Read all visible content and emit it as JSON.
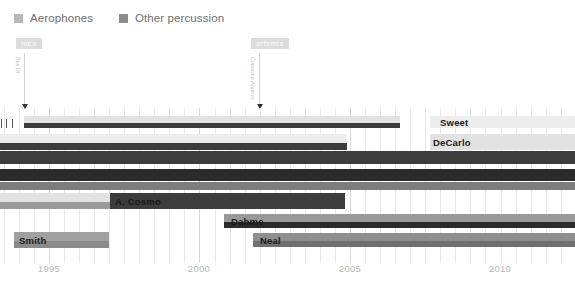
{
  "legend": {
    "items": [
      {
        "label": "Aerophones",
        "color": "#b7b7b7"
      },
      {
        "label": "Other percussion",
        "color": "#8c8c8c"
      }
    ]
  },
  "events": [
    {
      "name": "mco",
      "pill_label": "mco",
      "vertical_label": "Bks Dr",
      "x": 24
    },
    {
      "name": "artemis",
      "pill_label": "artemis",
      "vertical_label": "Coporate Amercy",
      "x": 259
    }
  ],
  "axis": {
    "ticks": [
      {
        "label": "1995",
        "x": 49
      },
      {
        "label": "2000",
        "x": 199
      },
      {
        "label": "2005",
        "x": 350
      },
      {
        "label": "2010",
        "x": 500
      }
    ],
    "minor_step_px": 30.1,
    "x_min_year": 1993.4,
    "x_max_year": 2012.3
  },
  "colors": {
    "light": "#e2e2e2",
    "lightest": "#ededed",
    "mid": "#9a9a9a",
    "dark": "#3c3c3c",
    "darkest": "#2b2b2b",
    "grid": "#e9e9e9",
    "grid_major": "#d8d8d8",
    "axis_text": "#b9b9b9",
    "legend_text": "#6e6e6e",
    "event_pill_bg": "#dcdcdc",
    "event_pill_text": "#f4f4f4"
  },
  "chart_data": {
    "type": "bar",
    "title": "",
    "xlabel": "",
    "ylabel": "",
    "orientation": "horizontal-timeline",
    "grid": true,
    "legend_position": "top-left",
    "xlim": [
      1993.4,
      2012.3
    ],
    "categories": [
      "Sweet",
      "DeCarlo",
      "row-3",
      "row-4",
      "row-5",
      "A. Cosmo",
      "Dahme",
      "Neal",
      "Smith"
    ],
    "rows": [
      {
        "name": "sweet-row",
        "label": "Sweet",
        "label_x": 437,
        "y": 116,
        "height": 12,
        "segments": [
          {
            "x": 24,
            "width": 376,
            "color": "#e2e2e2",
            "band": "top",
            "series": "Aerophones"
          },
          {
            "x": 24,
            "width": 376,
            "color": "#3c3c3c",
            "band": "bottom",
            "series": "Other percussion"
          },
          {
            "x": 430,
            "width": 145,
            "color": "#ededed",
            "band": "full",
            "series": "Aerophones"
          }
        ]
      },
      {
        "name": "decarlo-row",
        "label": "DeCarlo",
        "label_x": 430,
        "y": 134,
        "height": 16,
        "segments": [
          {
            "x": 0,
            "width": 347,
            "color": "#ededed",
            "band": "top",
            "series": "Aerophones"
          },
          {
            "x": 0,
            "width": 347,
            "color": "#3c3c3c",
            "band": "bottom",
            "series": "Other percussion"
          },
          {
            "x": 430,
            "width": 145,
            "color": "#e2e2e2",
            "band": "full",
            "series": "Aerophones"
          }
        ]
      },
      {
        "name": "row-3",
        "label": "",
        "y": 151,
        "height": 13,
        "segments": [
          {
            "x": 0,
            "width": 575,
            "color": "#3c3c3c",
            "band": "full",
            "series": "Other percussion"
          }
        ]
      },
      {
        "name": "row-4",
        "label": "",
        "y": 169,
        "height": 12,
        "segments": [
          {
            "x": 0,
            "width": 575,
            "color": "#2b2b2b",
            "band": "full",
            "series": "Other percussion"
          }
        ]
      },
      {
        "name": "row-5",
        "label": "",
        "y": 182,
        "height": 8,
        "segments": [
          {
            "x": 0,
            "width": 575,
            "color": "#7d7d7d",
            "band": "full",
            "series": "Other percussion"
          }
        ]
      },
      {
        "name": "acosmo-row",
        "label": "A. Cosmo",
        "label_x": 112,
        "y": 193,
        "height": 16,
        "segments": [
          {
            "x": 0,
            "width": 110,
            "color": "#e2e2e2",
            "band": "top",
            "series": "Aerophones"
          },
          {
            "x": 0,
            "width": 110,
            "color": "#9a9a9a",
            "band": "bottom",
            "series": "Other percussion"
          },
          {
            "x": 110,
            "width": 235,
            "color": "#3c3c3c",
            "band": "full",
            "series": "Other percussion"
          }
        ]
      },
      {
        "name": "dahme-row",
        "label": "Dahme",
        "label_x": 228,
        "y": 214,
        "height": 14,
        "segments": [
          {
            "x": 224,
            "width": 351,
            "color": "#9a9a9a",
            "band": "top",
            "series": "Aerophones"
          },
          {
            "x": 224,
            "width": 351,
            "color": "#2b2b2b",
            "band": "bottom",
            "series": "Other percussion"
          }
        ]
      },
      {
        "name": "neal-row",
        "label": "Neal",
        "label_x": 257,
        "y": 233,
        "height": 14,
        "segments": [
          {
            "x": 253,
            "width": 322,
            "color": "#8f8f8f",
            "band": "top",
            "series": "Aerophones"
          },
          {
            "x": 253,
            "width": 322,
            "color": "#6f6f6f",
            "band": "bottom",
            "series": "Other percussion"
          }
        ]
      },
      {
        "name": "smith-row",
        "label": "Smith",
        "label_x": 16,
        "y": 232,
        "height": 16,
        "segments": [
          {
            "x": 14,
            "width": 95,
            "color": "#a0a0a0",
            "band": "top",
            "series": "Aerophones"
          },
          {
            "x": 14,
            "width": 95,
            "color": "#8a8a8a",
            "band": "bottom",
            "series": "Other percussion"
          }
        ]
      }
    ],
    "left_ticks": [
      {
        "x": 6,
        "y": 119,
        "height": 9
      },
      {
        "x": 12,
        "y": 119,
        "height": 9
      },
      {
        "x": 1,
        "y": 119,
        "height": 9
      }
    ]
  }
}
